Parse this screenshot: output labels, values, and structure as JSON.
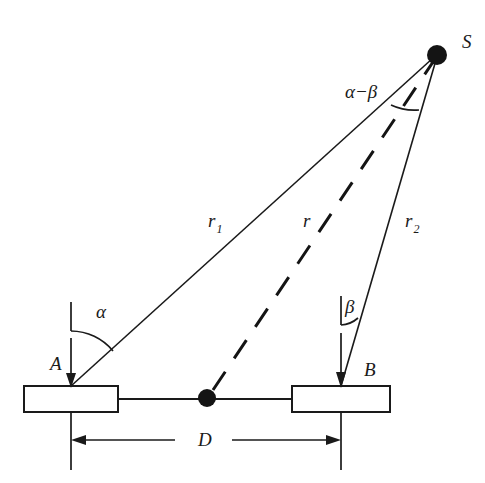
{
  "figure": {
    "background_color": "#ffffff",
    "ink_color": "#1a1a1a"
  },
  "labels": {
    "source_point": "S",
    "station_a": "A",
    "station_b": "B",
    "range_1": "r",
    "range_1_sub": "1",
    "range_mid": "r",
    "range_2": "r",
    "range_2_sub": "2",
    "angle_alpha": "α",
    "angle_beta": "β",
    "angle_difference": "α−β",
    "baseline_distance": "D"
  },
  "geometry": {
    "source": {
      "x": 437,
      "y": 55,
      "dot_radius": 10
    },
    "midpoint": {
      "x": 207,
      "y": 398,
      "dot_radius": 9
    },
    "station_a": {
      "vertex_x": 71,
      "vertex_y": 386,
      "box_x": 24,
      "box_y": 386,
      "box_w": 94,
      "box_h": 26
    },
    "station_b": {
      "vertex_x": 341,
      "vertex_y": 386,
      "box_x": 292,
      "box_y": 386,
      "box_w": 98,
      "box_h": 26
    },
    "baseline_y": 399,
    "dimension_line_y": 440,
    "extension_bottom_y": 470
  },
  "label_positions": {
    "source": {
      "x": 462,
      "y": 48
    },
    "station_a": {
      "x": 50,
      "y": 370
    },
    "station_b": {
      "x": 364,
      "y": 376
    },
    "range_1": {
      "x": 208,
      "y": 227
    },
    "range_mid": {
      "x": 303,
      "y": 227
    },
    "range_2": {
      "x": 405,
      "y": 227
    },
    "angle_alpha": {
      "x": 96,
      "y": 318
    },
    "angle_beta": {
      "x": 345,
      "y": 313
    },
    "angle_difference": {
      "x": 345,
      "y": 98
    },
    "baseline_distance": {
      "x": 198,
      "y": 444
    }
  }
}
